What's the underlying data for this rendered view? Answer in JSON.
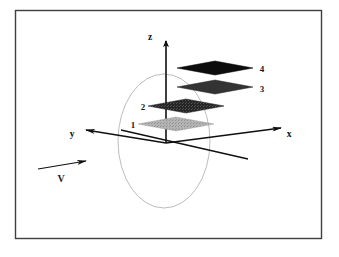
{
  "figure": {
    "background_color": "#ffffff",
    "border_color": "#3a3a3a",
    "line_color": "#101010",
    "ring_color": "#b9b9b9"
  },
  "axes": [
    {
      "id": "z",
      "label": "z",
      "label_x": 150,
      "label_y": 40,
      "direction": "up"
    },
    {
      "id": "y",
      "label": "y",
      "label_x": 72,
      "label_y": 137,
      "direction": "left"
    },
    {
      "id": "x",
      "label": "x",
      "label_x": 287,
      "label_y": 137,
      "direction": "right"
    }
  ],
  "origin": {
    "x": 166,
    "y": 143
  },
  "velocity_arrow": {
    "label": "V",
    "label_x": 61,
    "label_y": 182,
    "start_x": 38,
    "start_y": 169,
    "end_x": 90,
    "end_y": 160
  },
  "ring": {
    "name": "vertical-ellipse-ring",
    "center_x": 164,
    "center_y": 141,
    "radius_x": 46,
    "radius_y": 67
  },
  "planes": [
    {
      "id": "plane-1",
      "label": "1",
      "label_x": 133,
      "label_y": 128,
      "center_x": 176,
      "center_y": 124,
      "half_width": 38,
      "half_height": 7,
      "fill": "#b0b0b0",
      "shade": "light-gray"
    },
    {
      "id": "plane-2",
      "label": "2",
      "label_x": 143,
      "label_y": 110,
      "center_x": 186,
      "center_y": 106,
      "half_width": 38,
      "half_height": 7,
      "fill": "#2b2b2b",
      "shade": "dark-gray"
    },
    {
      "id": "plane-3",
      "label": "3",
      "label_x": 262,
      "label_y": 92,
      "center_x": 215,
      "center_y": 87,
      "half_width": 38,
      "half_height": 7,
      "fill": "#3a3a3a",
      "shade": "dark-gray"
    },
    {
      "id": "plane-4",
      "label": "4",
      "label_x": 262,
      "label_y": 72,
      "center_x": 215,
      "center_y": 68,
      "half_width": 38,
      "half_height": 7,
      "fill": "#0d0d0d",
      "shade": "black"
    }
  ]
}
